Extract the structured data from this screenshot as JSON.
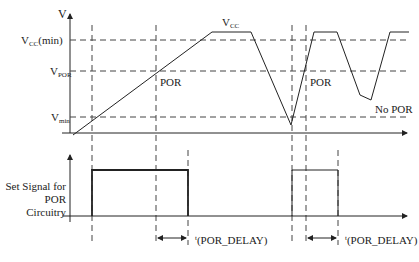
{
  "diagram": {
    "top_axis_label": "V",
    "levels": {
      "vcc_min": {
        "main": "V",
        "sub": "CC",
        "suffix": "(min)"
      },
      "vpor": {
        "main": "V",
        "sub": "POR"
      },
      "vmin": {
        "main": "V",
        "sub": "min"
      }
    },
    "curve_label": {
      "main": "V",
      "sub": "CC"
    },
    "annotations": {
      "por_1": "POR",
      "por_2": "POR",
      "no_por": "No  POR"
    },
    "bottom_signal_label_line1": "Set Signal for",
    "bottom_signal_label_line2": "POR Circuitry",
    "delay_labels": [
      {
        "prefix": "t",
        "text": "(POR_DELAY)"
      },
      {
        "prefix": "t",
        "text": "(POR_DELAY)"
      }
    ],
    "colors": {
      "line": "#222222",
      "dash": "#444444",
      "background": "#ffffff"
    }
  }
}
